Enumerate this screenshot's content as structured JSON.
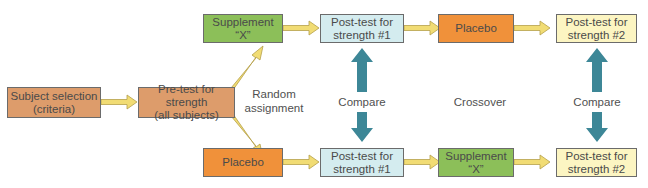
{
  "diagram": {
    "nodes": {
      "subject_selection": {
        "line1": "Subject selection",
        "line2": "(criteria)"
      },
      "pretest": {
        "line1": "Pre-test for strength",
        "line2": "(all subjects)"
      },
      "top_supplement": {
        "label": "Supplement “X”"
      },
      "top_posttest1": {
        "line1": "Post-test for",
        "line2": "strength #1"
      },
      "top_placebo": {
        "label": "Placebo"
      },
      "top_posttest2": {
        "line1": "Post-test for",
        "line2": "strength #2"
      },
      "bottom_placebo": {
        "label": "Placebo"
      },
      "bottom_posttest1": {
        "line1": "Post-test for",
        "line2": "strength #1"
      },
      "bottom_supplement": {
        "label": "Supplement “X”"
      },
      "bottom_posttest2": {
        "line1": "Post-test for",
        "line2": "strength #2"
      }
    },
    "labels": {
      "random_line1": "Random",
      "random_line2": "assignment",
      "compare1": "Compare",
      "crossover": "Crossover",
      "compare2": "Compare"
    },
    "colors": {
      "tan": "#dd9c6b",
      "green": "#8cbf59",
      "orange": "#f0913a",
      "light_blue": "#d4ecef",
      "cream": "#fcf5c2",
      "flow_arrow": "#f1dc74",
      "compare_arrow": "#3d8797"
    }
  }
}
